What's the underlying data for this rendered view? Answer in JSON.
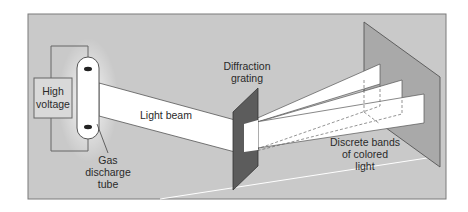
{
  "diagram": {
    "labels": {
      "high_voltage_line1": "High",
      "high_voltage_line2": "voltage",
      "light_beam": "Light beam",
      "gas_tube_line1": "Gas",
      "gas_tube_line2": "discharge",
      "gas_tube_line3": "tube",
      "grating_line1": "Diffraction",
      "grating_line2": "grating",
      "bands_line1": "Discrete bands",
      "bands_line2": "of colored",
      "bands_line3": "light"
    },
    "components": [
      "High voltage",
      "Gas discharge tube",
      "Light beam",
      "Diffraction grating",
      "Discrete bands of colored light",
      "Screen"
    ],
    "colors": {
      "background": "#c9c9c9",
      "frame": "#7a7a7a",
      "beam": "#ffffff",
      "grating": "#5a5a5a",
      "screen": "#a8a8a8",
      "box": "#d6d6d6",
      "line": "#555555"
    }
  }
}
